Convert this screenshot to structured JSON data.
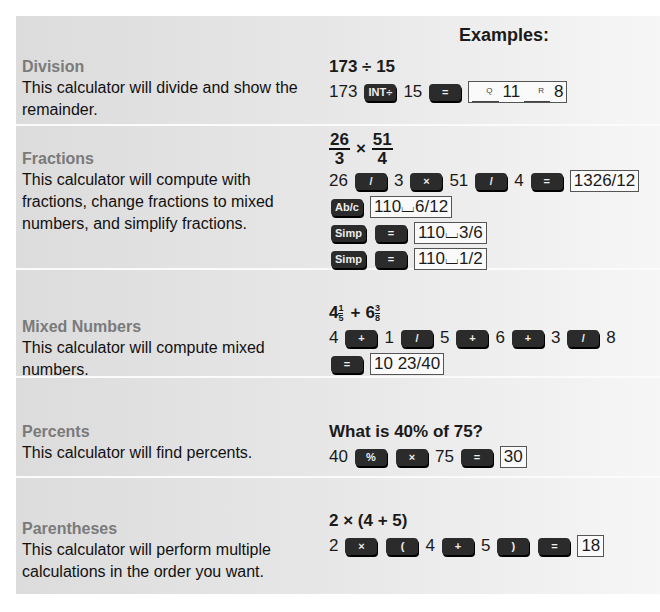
{
  "header": {
    "examples_label": "Examples:"
  },
  "sections": [
    {
      "title": "Division",
      "description": "This calculator will divide and show the remainder.",
      "expression": "173 ÷ 15",
      "keys": {
        "n1": "173",
        "k1": "INT÷",
        "n2": "15",
        "k2": "="
      },
      "result": {
        "q_label": "Q",
        "quotient": "11",
        "r_label": "R",
        "remainder": "8"
      }
    },
    {
      "title": "Fractions",
      "description": "This calculator will compute with fractions, change fractions to mixed numbers, and simplify fractions.",
      "expression": {
        "f1_num": "26",
        "f1_den": "3",
        "op": "×",
        "f2_num": "51",
        "f2_den": "4"
      },
      "line1": {
        "n1": "26",
        "k1": "/",
        "n2": "3",
        "k2": "×",
        "n3": "51",
        "k3": "/",
        "n4": "4",
        "k4": "=",
        "result": "1326/12"
      },
      "line2": {
        "k1": "Ab/c",
        "result": "110⌴6/12"
      },
      "line3": {
        "k1": "Simp",
        "k2": "=",
        "result": "110⌴3/6"
      },
      "line4": {
        "k1": "Simp",
        "k2": "=",
        "result": "110⌴1/2"
      }
    },
    {
      "title": "Mixed Numbers",
      "description": "This calculator will compute mixed numbers.",
      "expression": {
        "w1": "4",
        "n1": "1",
        "d1": "5",
        "op": "+",
        "w2": "6",
        "n2": "3",
        "d2": "8"
      },
      "line1": {
        "a": "4",
        "k1": "+",
        "b": "1",
        "k2": "/",
        "c": "5",
        "k3": "+",
        "d": "6",
        "k4": "+",
        "e": "3",
        "k5": "/",
        "f": "8"
      },
      "line2": {
        "k1": "=",
        "result": "10 23/40"
      }
    },
    {
      "title": "Percents",
      "description": "This calculator will find percents.",
      "expression": "What is 40% of 75?",
      "keys": {
        "n1": "40",
        "k1": "%",
        "k2": "×",
        "n2": "75",
        "k3": "=",
        "result": "30"
      }
    },
    {
      "title": "Parentheses",
      "description": "This calculator will perform multiple calculations in the order you want.",
      "expression": "2 × (4 + 5)",
      "keys": {
        "n1": "2",
        "k1": "×",
        "k2": "(",
        "n2": "4",
        "k3": "+",
        "n3": "5",
        "k4": ")",
        "k5": "=",
        "result": "18"
      }
    }
  ]
}
